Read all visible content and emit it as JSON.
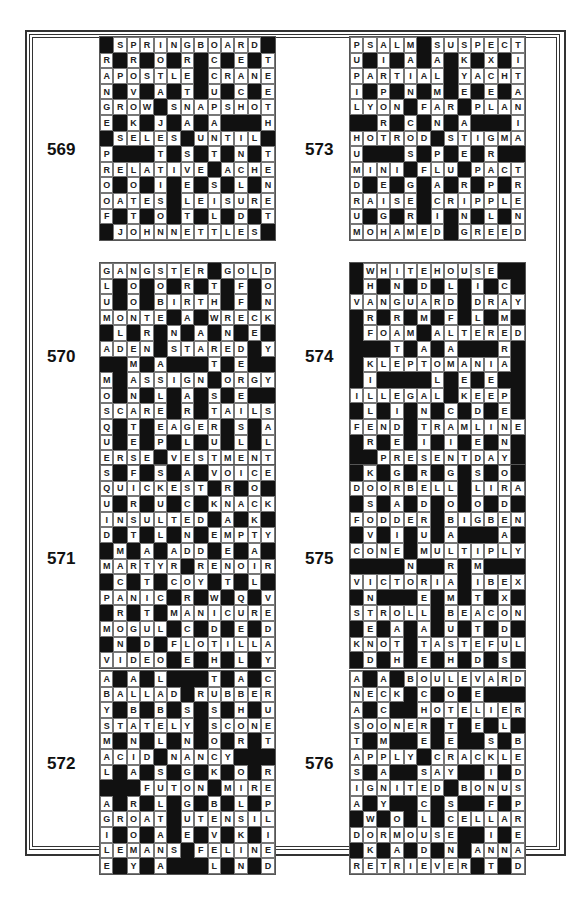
{
  "page": {
    "background": "#ffffff",
    "border_color": "#333333"
  },
  "puzzles": [
    {
      "number": "569",
      "grid": [
        "#SPRINGBOARD#",
        "R#R#O#R#C#E#T",
        "APOSTLE#CRANE",
        "N#V#A#T#U#C#E",
        "GROW#SNAPSHOT",
        "E#K#J#A#A###H",
        "#SELES#UNTIL#",
        "P###T#S#T#N#T",
        "RELATIVE#ACHE",
        "O#O#I#E#S#L#N",
        "OATES#LEISURE",
        "F#T#O#T#L#D#T",
        "#JOHNNETTLES#"
      ]
    },
    {
      "number": "573",
      "grid": [
        "PSALM#SUSPECT",
        "U#I#A#A#K#X#I",
        "PARTIAL#YACHT",
        "I#P#N#M#E#E#A",
        "LYON#FAR#PLAN",
        "##R#C#N#A###I",
        "HOTROD#STIGMA",
        "U###S#P#E#R##",
        "MINI#FLU#PACT",
        "D#E#G#A#R#P#R",
        "RAISE#CRIPPLE",
        "U#G#R#I#N#L#N",
        "MOHAMED#GREED"
      ]
    },
    {
      "number": "570",
      "grid": [
        "GANGSTER#GOLD",
        "L#O#O#R#T#F#O",
        "U#O#BIRTH#F#N",
        "MONTE#A#WRECK",
        "#L#R#N#A#N#E#",
        "ADEN#STARED#Y",
        "##M#A###T#E##",
        "M#ASSIGN#ORGY",
        "O#N#L#A#S#E#",
        "SCARE#R#TAILS",
        "Q#T#EAGER#S#A",
        "U#E#P#L#U#L#L",
        "ERSE#VESTMENT"
      ]
    },
    {
      "number": "574",
      "grid": [
        "#WHITEHOUSE##",
        "#H#N#D#L#I#C#",
        "VANGUARD#DRAY",
        "#R#R#M#F#L#M#",
        "#FOAM#ALTERED",
        "###T#A#A###R#",
        "#KLEPTOMANIA#",
        "#I####L#E#E##",
        "ILLEGAL#KEEP#",
        "#L#I#N#C#D#E#",
        "FEND#TRAMLINE",
        "#R#E#I#I#E#N#",
        "##PRESENTDAY#"
      ]
    },
    {
      "number": "571",
      "grid": [
        "S#F#S#A#VOICE",
        "QUICKEST#R#O#",
        "U#R#U#C#KNACK",
        "INSULTED#A#K#",
        "D#T#L#N#EMPTY",
        "#M#A#ADD#E#A#",
        "MARTYR#RENOIR",
        "#C#T#COY#T#L#",
        "PANIC#R#W#Q#V",
        "#R#T#MANICURE",
        "MOGUL#C#D#E#D",
        "#N#D#FLOTILLA",
        "VIDEO#E#H#L#Y"
      ]
    },
    {
      "number": "575",
      "grid": [
        "#K#G#R#G#S#O#",
        "DOORBELL#LIRA",
        "#S#A#D#O#O#D#",
        "FODDER#BIGBEN",
        "#V#I#U#A###A#",
        "CONE#MULTIPLY",
        "####N##R#M###",
        "VICTORIA#IBEX",
        "#N###E#M#T#X#",
        "STROLL#BEACON",
        "#E#A#A#U#T#D#",
        "KNOT#TASTEFUL",
        "#D#H#E#H#D#S#"
      ]
    },
    {
      "number": "572",
      "grid": [
        "A#A#L###T#A#C",
        "BALLAD#RUBBER",
        "Y#B#B#S#S#H#U",
        "STATELY#SCONE",
        "M#N#L#N#O#R#T",
        "ACID#NANCY###",
        "L#A#S#G#K#O#R",
        "###FUTON#MIRE",
        "A#R#L#G#B#L#P",
        "GROAT#UTENSIL",
        "I#O#A#E#V#K#I",
        "LEMANS#FELINE",
        "E#Y#A###L#N#D"
      ]
    },
    {
      "number": "576",
      "grid": [
        "A#A#BOULEVARD",
        "NECK#C#O#E##",
        "A#C##HOTELIER",
        "SOONER#T#E#L#",
        "T#M##E#E##S#B",
        "APPLY#CRACKLE",
        "S#A##SAY##I#D",
        "IGNITED#BONUS",
        "A#Y##C#S##F#P",
        "#W#O#L#CELLAR",
        "DORMOUSE##I#E",
        "#K#A#D#N#ANNA",
        "RETRIEVER#T#D"
      ]
    }
  ]
}
